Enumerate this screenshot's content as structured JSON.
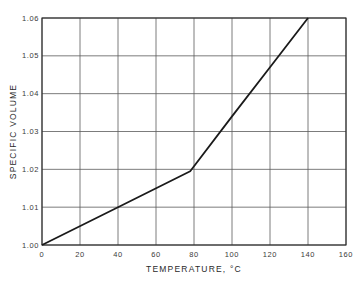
{
  "chart_data": {
    "type": "line",
    "title": "",
    "xlabel": "TEMPERATURE, °C",
    "ylabel": "SPECIFIC VOLUME",
    "xlim": [
      0,
      160
    ],
    "ylim": [
      1.0,
      1.06
    ],
    "grid": true,
    "x_ticks": [
      0,
      20,
      40,
      60,
      80,
      100,
      120,
      140,
      160
    ],
    "x_tick_labels": [
      "0",
      "20",
      "40",
      "60",
      "80",
      "100",
      "120",
      "140",
      "160"
    ],
    "y_ticks": [
      1.0,
      1.01,
      1.02,
      1.03,
      1.04,
      1.05,
      1.06
    ],
    "y_tick_labels": [
      "1.00",
      "1.01",
      "1.02",
      "1.03",
      "1.04",
      "1.05",
      "1.06"
    ],
    "series": [
      {
        "name": "Specific volume",
        "x": [
          0,
          40,
          78,
          100,
          120,
          140
        ],
        "y": [
          1.0,
          1.01,
          1.0195,
          1.034,
          1.047,
          1.06
        ]
      }
    ],
    "legend": null
  },
  "layout": {
    "plot_left": 42,
    "plot_right": 346,
    "plot_top": 18,
    "plot_bottom": 245
  }
}
